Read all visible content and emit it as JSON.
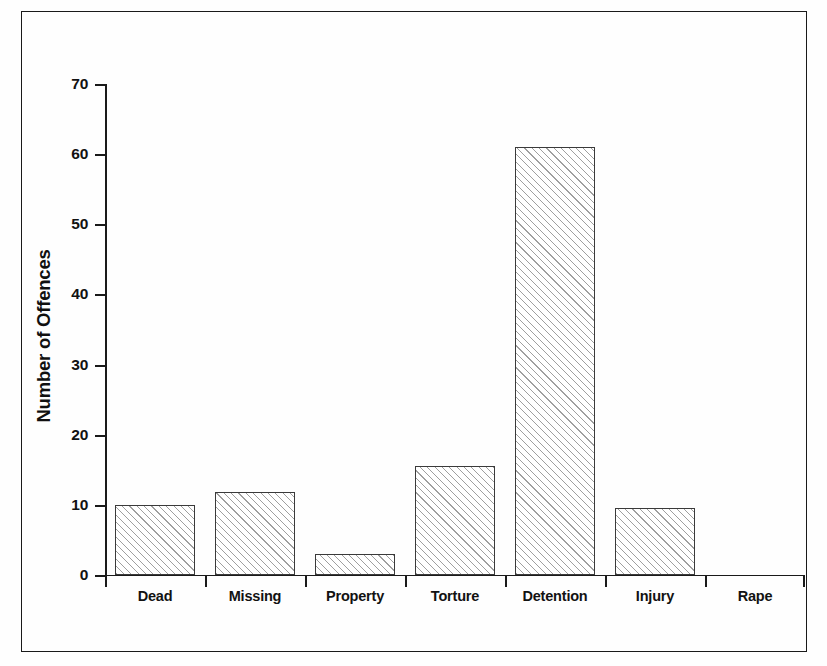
{
  "chart_data": {
    "type": "bar",
    "title": "",
    "subtitle": "",
    "xlabel": "",
    "ylabel": "Number of Offences",
    "categories": [
      "Dead",
      "Missing",
      "Property",
      "Torture",
      "Detention",
      "Injury",
      "Rape"
    ],
    "values": [
      10,
      11.8,
      3,
      15.5,
      61,
      9.6,
      0
    ],
    "ylim": [
      0,
      70
    ],
    "yticks": [
      0,
      10,
      20,
      30,
      40,
      50,
      60,
      70
    ],
    "ytick_labels": [
      "0",
      "10",
      "20",
      "30",
      "40",
      "50",
      "60",
      "70"
    ],
    "grid": false,
    "legend": false,
    "legend_position": "none",
    "series": [
      {
        "name": "Number of Offences",
        "values": [
          10,
          11.8,
          3,
          15.5,
          61,
          9.6,
          0
        ]
      }
    ],
    "bar_fill": "diagonal-hatch",
    "bar_fill_color": "#ffffff",
    "bar_edge_color": "#3a3a3a"
  },
  "axes": {
    "y_title": "Number of Offences",
    "y_labels": {
      "t0": "0",
      "t10": "10",
      "t20": "20",
      "t30": "30",
      "t40": "40",
      "t50": "50",
      "t60": "60",
      "t70": "70"
    },
    "x_labels": {
      "c0": "Dead",
      "c1": "Missing",
      "c2": "Property",
      "c3": "Torture",
      "c4": "Detention",
      "c5": "Injury",
      "c6": "Rape"
    }
  },
  "colors": {
    "axis": "#1a1a1a",
    "text": "#121212",
    "bar_edge": "#3a3a3a",
    "bar_face": "#ffffff",
    "hatch": "#505050",
    "frame": "#1a1a1a",
    "page": "#fefefe"
  }
}
